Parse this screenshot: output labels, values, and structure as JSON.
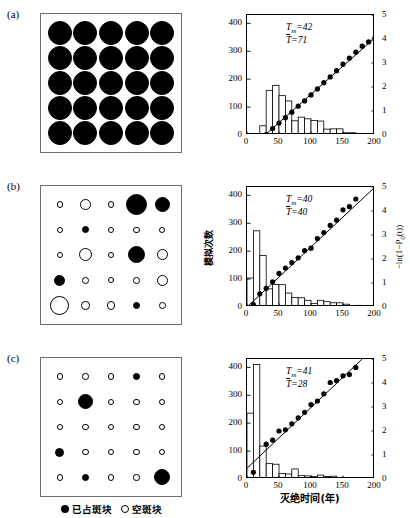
{
  "figure": {
    "panels": [
      {
        "label": "(a)"
      },
      {
        "label": "(b)"
      },
      {
        "label": "(c)"
      }
    ],
    "legend": {
      "occupied_label": "已占斑块",
      "empty_label": "空斑块"
    },
    "axes": {
      "ylabel_left": "模拟次数",
      "ylabel_right": "−ln(1−P0(t))",
      "ylabel_right_parts": {
        "prefix": "−ln(1−P",
        "sub": "0",
        "suffix": "(t))"
      },
      "xlabel": "灭绝时间(年)",
      "yticks_left": [
        "0",
        "100",
        "200",
        "300",
        "400"
      ],
      "yticks_right": [
        "0",
        "1",
        "2",
        "3",
        "4",
        "5"
      ],
      "xticks": [
        "0",
        "50",
        "100",
        "150",
        "200"
      ]
    },
    "lattices": [
      {
        "panel": "(a)",
        "rows": [
          [
            {
              "f": 1,
              "r": 12
            },
            {
              "f": 1,
              "r": 12
            },
            {
              "f": 1,
              "r": 12
            },
            {
              "f": 1,
              "r": 12
            },
            {
              "f": 1,
              "r": 12
            }
          ],
          [
            {
              "f": 1,
              "r": 12
            },
            {
              "f": 1,
              "r": 12
            },
            {
              "f": 1,
              "r": 12
            },
            {
              "f": 1,
              "r": 12
            },
            {
              "f": 1,
              "r": 12
            }
          ],
          [
            {
              "f": 1,
              "r": 12
            },
            {
              "f": 1,
              "r": 12
            },
            {
              "f": 1,
              "r": 12
            },
            {
              "f": 1,
              "r": 12
            },
            {
              "f": 1,
              "r": 12
            }
          ],
          [
            {
              "f": 1,
              "r": 12
            },
            {
              "f": 1,
              "r": 12
            },
            {
              "f": 1,
              "r": 12
            },
            {
              "f": 1,
              "r": 12
            },
            {
              "f": 1,
              "r": 12
            }
          ],
          [
            {
              "f": 1,
              "r": 12
            },
            {
              "f": 1,
              "r": 12
            },
            {
              "f": 1,
              "r": 12
            },
            {
              "f": 1,
              "r": 12
            },
            {
              "f": 1,
              "r": 12
            }
          ]
        ]
      },
      {
        "panel": "(b)",
        "rows": [
          [
            {
              "f": 0,
              "r": 3.2
            },
            {
              "f": 0,
              "r": 5.5
            },
            {
              "f": 0,
              "r": 3.2
            },
            {
              "f": 1,
              "r": 10.5
            },
            {
              "f": 1,
              "r": 7.5
            }
          ],
          [
            {
              "f": 0,
              "r": 3.2
            },
            {
              "f": 1,
              "r": 3.4
            },
            {
              "f": 0,
              "r": 3.2
            },
            {
              "f": 0,
              "r": 3.2
            },
            {
              "f": 0,
              "r": 3.2
            }
          ],
          [
            {
              "f": 0,
              "r": 3.2
            },
            {
              "f": 0,
              "r": 6.5
            },
            {
              "f": 0,
              "r": 3.2
            },
            {
              "f": 1,
              "r": 8.5
            },
            {
              "f": 0,
              "r": 5.5
            }
          ],
          [
            {
              "f": 1,
              "r": 5.5
            },
            {
              "f": 0,
              "r": 3.4
            },
            {
              "f": 0,
              "r": 3.2
            },
            {
              "f": 0,
              "r": 3.4
            },
            {
              "f": 0,
              "r": 5.5
            }
          ],
          [
            {
              "f": 0,
              "r": 9.5
            },
            {
              "f": 0,
              "r": 4.2
            },
            {
              "f": 0,
              "r": 4.2
            },
            {
              "f": 1,
              "r": 3.6
            },
            {
              "f": 0,
              "r": 3.4
            }
          ]
        ]
      },
      {
        "panel": "(c)",
        "rows": [
          [
            {
              "f": 0,
              "r": 3.2
            },
            {
              "f": 0,
              "r": 3.2
            },
            {
              "f": 0,
              "r": 3.2
            },
            {
              "f": 1,
              "r": 3.4
            },
            {
              "f": 0,
              "r": 3.2
            }
          ],
          [
            {
              "f": 0,
              "r": 3.2
            },
            {
              "f": 1,
              "r": 7.5
            },
            {
              "f": 0,
              "r": 3.2
            },
            {
              "f": 0,
              "r": 3.2
            },
            {
              "f": 0,
              "r": 3.2
            }
          ],
          [
            {
              "f": 0,
              "r": 3.2
            },
            {
              "f": 0,
              "r": 3.2
            },
            {
              "f": 0,
              "r": 3.2
            },
            {
              "f": 0,
              "r": 3.2
            },
            {
              "f": 0,
              "r": 3.2
            }
          ],
          [
            {
              "f": 1,
              "r": 4.6
            },
            {
              "f": 0,
              "r": 3.2
            },
            {
              "f": 0,
              "r": 3.2
            },
            {
              "f": 0,
              "r": 3.2
            },
            {
              "f": 0,
              "r": 3.2
            }
          ],
          [
            {
              "f": 0,
              "r": 3.2
            },
            {
              "f": 1,
              "r": 3.4
            },
            {
              "f": 0,
              "r": 3.2
            },
            {
              "f": 0,
              "r": 3.2
            },
            {
              "f": 1,
              "r": 8.0
            }
          ]
        ]
      }
    ]
  },
  "chart_data": [
    {
      "panel": "(a)",
      "type": "bar",
      "title": "",
      "annotations": {
        "Tm_prefix": "T",
        "Tm_sub": "m",
        "Tm_value": "=42",
        "Tbar_prefix": "T",
        "Tbar_value": "=71"
      },
      "Tm": 42,
      "Tbar": 71,
      "xlabel": "灭绝时间(年)",
      "ylabel": "模拟次数",
      "ylabel2": "−ln(1−P0(t))",
      "xlim": [
        0,
        200
      ],
      "ylim": [
        0,
        430
      ],
      "ylim2": [
        0,
        5
      ],
      "grid": false,
      "bin_width": 10,
      "bin_starts": [
        20,
        30,
        40,
        50,
        60,
        70,
        80,
        90,
        100,
        110,
        120,
        130,
        140,
        150,
        160,
        170,
        180,
        190
      ],
      "values": [
        33,
        160,
        178,
        141,
        122,
        51,
        64,
        58,
        52,
        50,
        21,
        22,
        22,
        8,
        8,
        4,
        4,
        4
      ],
      "series": [
        {
          "name": "-ln(1-P0(t))",
          "marker": "filled-circle",
          "x": [
            30,
            40,
            50,
            60,
            70,
            80,
            90,
            100,
            110,
            120,
            130,
            140,
            150,
            160,
            170,
            180,
            190,
            200
          ],
          "y": [
            0.02,
            0.27,
            0.5,
            0.72,
            0.95,
            1.2,
            1.42,
            1.67,
            1.92,
            2.18,
            2.42,
            2.68,
            2.95,
            3.2,
            3.45,
            3.7,
            3.88,
            4.05
          ]
        }
      ],
      "fit_line": {
        "x": [
          28,
          200
        ],
        "y": [
          0.0,
          4.05
        ]
      }
    },
    {
      "panel": "(b)",
      "type": "bar",
      "title": "",
      "annotations": {
        "Tm_prefix": "T",
        "Tm_sub": "m",
        "Tm_value": "=40",
        "Tbar_prefix": "T",
        "Tbar_value": "=40"
      },
      "Tm": 40,
      "Tbar": 40,
      "xlabel": "灭绝时间(年)",
      "ylabel": "模拟次数",
      "ylabel2": "−ln(1−P0(t))",
      "xlim": [
        0,
        200
      ],
      "ylim": [
        0,
        430
      ],
      "ylim2": [
        0,
        5
      ],
      "grid": false,
      "bin_width": 10,
      "bin_starts": [
        0,
        10,
        20,
        30,
        40,
        50,
        60,
        70,
        80,
        90,
        100,
        110,
        120,
        130,
        140,
        150,
        160,
        170,
        180,
        190
      ],
      "values": [
        104,
        273,
        185,
        65,
        81,
        80,
        50,
        34,
        33,
        24,
        13,
        24,
        19,
        15,
        15,
        10,
        4,
        6,
        4,
        2
      ],
      "series": [
        {
          "name": "-ln(1-P0(t))",
          "marker": "filled-circle",
          "x": [
            10,
            20,
            30,
            40,
            50,
            60,
            70,
            80,
            90,
            100,
            110,
            120,
            130,
            140,
            150,
            160,
            170
          ],
          "y": [
            0.1,
            0.55,
            0.78,
            1.05,
            1.4,
            1.62,
            1.85,
            2.05,
            2.35,
            2.45,
            2.85,
            3.1,
            3.4,
            3.62,
            4.05,
            4.18,
            4.5
          ]
        }
      ],
      "fit_line": {
        "x": [
          0,
          200
        ],
        "y": [
          0.0,
          5.0
        ]
      }
    },
    {
      "panel": "(c)",
      "type": "bar",
      "title": "",
      "annotations": {
        "Tm_prefix": "T",
        "Tm_sub": "m",
        "Tm_value": "=41",
        "Tbar_prefix": "T",
        "Tbar_value": "=28"
      },
      "Tm": 41,
      "Tbar": 28,
      "xlabel": "灭绝时间(年)",
      "ylabel": "模拟次数",
      "ylabel2": "−ln(1−P0(t))",
      "xlim": [
        0,
        200
      ],
      "ylim": [
        0,
        430
      ],
      "ylim2": [
        0,
        5
      ],
      "grid": false,
      "bin_width": 10,
      "bin_starts": [
        0,
        10,
        20,
        30,
        40,
        50,
        60,
        70,
        80,
        90,
        100,
        110,
        120,
        130,
        140,
        150,
        160,
        170,
        180
      ],
      "values": [
        236,
        410,
        118,
        55,
        53,
        20,
        18,
        36,
        12,
        11,
        9,
        14,
        9,
        10,
        5,
        2,
        5,
        2,
        2
      ],
      "series": [
        {
          "name": "-ln(1-P0(t))",
          "marker": "filled-circle",
          "x": [
            10,
            30,
            40,
            50,
            60,
            70,
            80,
            90,
            100,
            110,
            120,
            130,
            140,
            150,
            160,
            170
          ],
          "y": [
            0.28,
            1.45,
            1.62,
            2.0,
            2.05,
            2.3,
            2.55,
            2.78,
            3.1,
            3.25,
            3.55,
            4.02,
            4.1,
            4.3,
            4.35,
            4.65
          ]
        }
      ],
      "fit_line": {
        "x": [
          0,
          180
        ],
        "y": [
          0.45,
          5.0
        ]
      }
    }
  ]
}
